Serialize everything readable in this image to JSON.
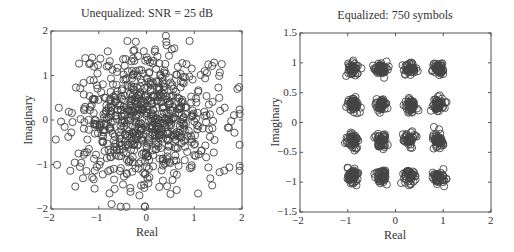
{
  "chart_data": [
    {
      "type": "scatter",
      "title": "Unequalized: SNR = 25 dB",
      "xlabel": "Real",
      "ylabel": "Imaginary",
      "xlim": [
        -2,
        2
      ],
      "ylim": [
        -2,
        2
      ],
      "xticks": [
        "-2",
        "-1",
        "0",
        "1",
        "2"
      ],
      "yticks": [
        "-2",
        "-1",
        "0",
        "1",
        "2"
      ],
      "marker": "open-circle",
      "marker_color": "#444444",
      "grid": false,
      "description": "Dispersed cloud of ~750 received symbols spread roughly uniformly over [-1.8,1.9] on both axes, denser near the center",
      "points_generated": {
        "count": 750,
        "seed": 7,
        "spread": 0.75
      }
    },
    {
      "type": "scatter",
      "title": "Equalized: 750 symbols",
      "xlabel": "Real",
      "ylabel": "Imaginary",
      "xlim": [
        -2,
        2
      ],
      "ylim": [
        -1.5,
        1.5
      ],
      "xticks": [
        "-2",
        "-1",
        "0",
        "1",
        "2"
      ],
      "yticks": [
        "-1.5",
        "-1",
        "-0.5",
        "0",
        "0.5",
        "1",
        "1.5"
      ],
      "marker": "open-circle",
      "marker_color": "#444444",
      "grid": false,
      "description": "16-QAM constellation: 16 tight clusters centered at real/imag in {-0.9,-0.3,0.3,0.9}",
      "cluster_centers_real": [
        -0.9,
        -0.3,
        0.3,
        0.9
      ],
      "cluster_centers_imag": [
        -0.9,
        -0.3,
        0.3,
        0.9
      ],
      "points_generated": {
        "count": 750,
        "seed": 11,
        "spread": 0.06
      }
    }
  ]
}
